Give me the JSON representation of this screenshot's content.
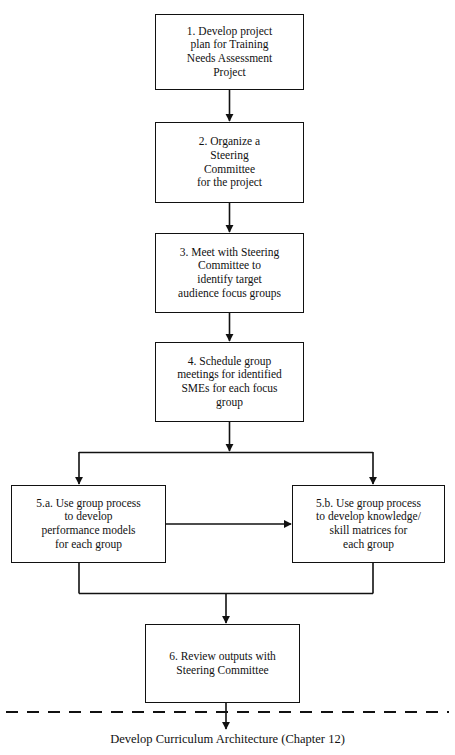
{
  "diagram": {
    "title_caption": "Develop Curriculum Architecture (Chapter 12)",
    "nodes": [
      {
        "id": "step-1",
        "label": "1. Develop project\nplan for Training\nNeeds Assessment\nProject",
        "x": 155,
        "y": 14,
        "w": 149,
        "h": 76,
        "font_size": 11.5
      },
      {
        "id": "step-2",
        "label": "2. Organize a\nSteering\nCommittee\nfor the project",
        "x": 155,
        "y": 122,
        "w": 149,
        "h": 81,
        "font_size": 11.5
      },
      {
        "id": "step-3",
        "label": "3. Meet with Steering\nCommittee to\nidentify target\naudience focus groups",
        "x": 155,
        "y": 233,
        "w": 149,
        "h": 80,
        "font_size": 11.5
      },
      {
        "id": "step-4",
        "label": "4. Schedule group\nmeetings for identified\nSMEs for each focus\ngroup",
        "x": 155,
        "y": 342,
        "w": 149,
        "h": 80,
        "font_size": 11.5
      },
      {
        "id": "step-5a",
        "label": "5.a. Use group process\nto develop\nperformance models\nfor each group",
        "x": 11,
        "y": 485,
        "w": 155,
        "h": 78,
        "font_size": 11.5
      },
      {
        "id": "step-5b",
        "label": "5.b. Use group process\nto develop knowledge/\nskill matrices for\neach group",
        "x": 292,
        "y": 485,
        "w": 153,
        "h": 78,
        "font_size": 11.5
      },
      {
        "id": "step-6",
        "label": "6. Review outputs with\nSteering Committee",
        "x": 145,
        "y": 624,
        "w": 155,
        "h": 79,
        "font_size": 11.5
      }
    ],
    "edges": [
      {
        "id": "edge-1-to-2",
        "from": "step-1",
        "to": "step-2",
        "kind": "straight-down"
      },
      {
        "id": "edge-2-to-3",
        "from": "step-2",
        "to": "step-3",
        "kind": "straight-down"
      },
      {
        "id": "edge-3-to-4",
        "from": "step-3",
        "to": "step-4",
        "kind": "straight-down"
      },
      {
        "id": "edge-4-to-split",
        "from": "step-4",
        "to": "split-bus",
        "kind": "straight-down"
      },
      {
        "id": "edge-split-to-5a",
        "from": "split-bus",
        "to": "step-5a",
        "kind": "branch-left"
      },
      {
        "id": "edge-split-to-5b",
        "from": "split-bus",
        "to": "step-5b",
        "kind": "branch-right"
      },
      {
        "id": "edge-5a-to-5b",
        "from": "step-5a",
        "to": "step-5b",
        "kind": "horizontal"
      },
      {
        "id": "edge-5a-to-merge",
        "from": "step-5a",
        "to": "merge-bus",
        "kind": "merge-left"
      },
      {
        "id": "edge-5b-to-merge",
        "from": "step-5b",
        "to": "merge-bus",
        "kind": "merge-right"
      },
      {
        "id": "edge-merge-to-6",
        "from": "merge-bus",
        "to": "step-6",
        "kind": "straight-down"
      },
      {
        "id": "edge-6-to-caption",
        "from": "step-6",
        "to": "caption",
        "kind": "straight-down-through-boundary"
      }
    ],
    "boundary": {
      "id": "phase-boundary",
      "style": "dashed",
      "y": 712,
      "x1": 6,
      "x2": 449
    },
    "colors": {
      "stroke": "#111111",
      "background": "#ffffff",
      "text": "#111111"
    },
    "caption_position": {
      "x": 227,
      "y": 732,
      "font_size": 12.5
    }
  }
}
